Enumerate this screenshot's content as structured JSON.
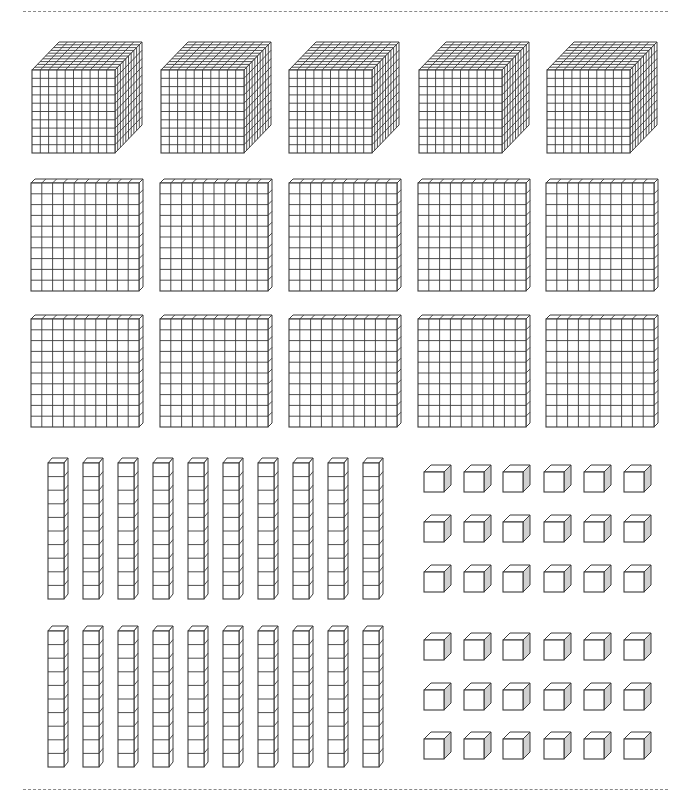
{
  "page": {
    "header_rule_y": 11,
    "footer_rule_y": 789
  },
  "colors": {
    "stroke": "#3a3a3a",
    "face": "#ffffff",
    "side_shade": "#d0d0d0",
    "rule": "#8a8a8a"
  },
  "blocks": {
    "thousands_cubes": {
      "label": "thousand cubes",
      "count": 5,
      "grid": 10,
      "x": [
        32,
        161,
        289,
        419,
        547
      ],
      "y_front_top": 70,
      "front_size": 83,
      "depth_dx": 27,
      "depth_dy": 28
    },
    "hundreds_flats": {
      "label": "hundred flats",
      "count": 10,
      "grid": 10,
      "rows": [
        {
          "y_front_top": 183,
          "x": [
            31,
            160,
            289,
            418,
            546
          ]
        },
        {
          "y_front_top": 319,
          "x": [
            31,
            160,
            289,
            418,
            546
          ]
        }
      ],
      "front_size": 108,
      "depth_dx": 4,
      "depth_dy": 4
    },
    "tens_rods": {
      "label": "ten rods",
      "count": 20,
      "units": 10,
      "rows": [
        {
          "y_front_top": 463,
          "bottom": 599
        },
        {
          "y_front_top": 631,
          "bottom": 767
        }
      ],
      "x": [
        48,
        83,
        118,
        153,
        188,
        223,
        258,
        293,
        328,
        363
      ],
      "front_width": 16,
      "depth_dx": 4,
      "depth_dy": 5
    },
    "ones_cubes": {
      "label": "unit cubes",
      "count": 36,
      "x": [
        424,
        464,
        503,
        544,
        584,
        624
      ],
      "rows_y_front_top": [
        472,
        522,
        572,
        640,
        690,
        739
      ],
      "front_size": 20,
      "depth_dx": 7,
      "depth_dy": 7
    }
  }
}
